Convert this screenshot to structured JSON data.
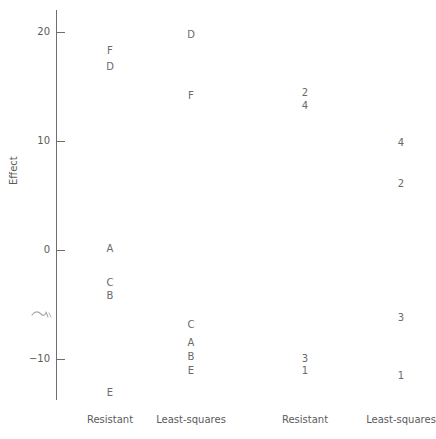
{
  "chart_data": {
    "type": "scatter",
    "title": "",
    "xlabel": "",
    "ylabel": "Effect",
    "ylim": [
      -15,
      22
    ],
    "grid": false,
    "legend": "none",
    "yticks": [
      20,
      10,
      0,
      -10
    ],
    "ytick_labels": [
      "20",
      "10",
      "0",
      "−10"
    ],
    "categories": [
      "Resistant",
      "Least-squares",
      "Resistant",
      "Least-squares"
    ],
    "series": [
      {
        "name": "Resistant",
        "group_index": 0,
        "points": [
          {
            "label": "F",
            "value": 18.3
          },
          {
            "label": "D",
            "value": 16.8
          },
          {
            "label": "A",
            "value": 0.1
          },
          {
            "label": "C",
            "value": -3.0
          },
          {
            "label": "B",
            "value": -4.2
          },
          {
            "label": "E",
            "value": -13.1
          }
        ]
      },
      {
        "name": "Least-squares",
        "group_index": 1,
        "points": [
          {
            "label": "D",
            "value": 19.7
          },
          {
            "label": "F",
            "value": 14.1
          },
          {
            "label": "C",
            "value": -6.9
          },
          {
            "label": "A",
            "value": -8.5
          },
          {
            "label": "B",
            "value": -9.8
          },
          {
            "label": "E",
            "value": -11.1
          }
        ]
      },
      {
        "name": "Resistant",
        "group_index": 2,
        "points": [
          {
            "label": "2",
            "value": 14.4
          },
          {
            "label": "4",
            "value": 13.2
          },
          {
            "label": "3",
            "value": -10.0
          },
          {
            "label": "1",
            "value": -11.1
          }
        ]
      },
      {
        "name": "Least-squares",
        "group_index": 3,
        "points": [
          {
            "label": "4",
            "value": 9.8
          },
          {
            "label": "2",
            "value": 6.1
          },
          {
            "label": "3",
            "value": -6.2
          },
          {
            "label": "1",
            "value": -11.6
          }
        ]
      }
    ]
  },
  "axis": {
    "y_title": "Effect",
    "ticks": [
      {
        "label": "20",
        "value": 20
      },
      {
        "label": "10",
        "value": 10
      },
      {
        "label": "0",
        "value": 0
      },
      {
        "label": "−10",
        "value": -10
      }
    ]
  },
  "groups": [
    {
      "label": "Resistant"
    },
    {
      "label": "Least-squares"
    },
    {
      "label": "Resistant"
    },
    {
      "label": "Least-squares"
    }
  ],
  "caption": {
    "text": ""
  },
  "colors": {
    "axis": "#6e6e6e",
    "text": "#5b5b5b",
    "point_text": "#6a6a6a",
    "background": "#ffffff"
  }
}
